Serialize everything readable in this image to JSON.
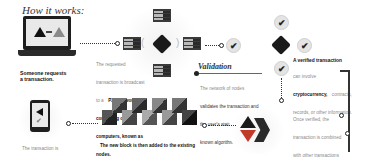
{
  "title": "How it works:",
  "steps": {
    "request": {
      "label_line1": "Someone requests",
      "label_line2": "a transaction."
    },
    "broadcast": {
      "text_light": "The requested transaction is broadcast to a",
      "text_bold": "P2P network consisting of computers, known as nodes."
    },
    "validation": {
      "heading": "Validation",
      "text_light": "The network of nodes",
      "text_bold": "validates the transaction and the user's status using known algorithms."
    },
    "verified": {
      "heading": "A verified transaction",
      "text_light1": "can involve",
      "text_bold": "cryptocurrency,",
      "text_light2": "contracts, records, or other information."
    },
    "combined": {
      "text_light": "Once verified, the transaction is combined with other transactions",
      "text_bold": "to create a new block of data for the ledger."
    },
    "added": {
      "text_bold": "The new block is then added to the existing blockchain,",
      "text_light": "in a way that is permanent and unalterable."
    },
    "complete": {
      "text_light": "The transaction is complete."
    }
  },
  "icons": {
    "laptop": "laptop-icon",
    "phone": "phone-icon",
    "server": "server-icon",
    "check": "✔",
    "arrow": "→"
  },
  "colors": {
    "accent_dark": "#222222",
    "accent_red": "#c0392b",
    "accent_grey": "#8a8a8a"
  }
}
